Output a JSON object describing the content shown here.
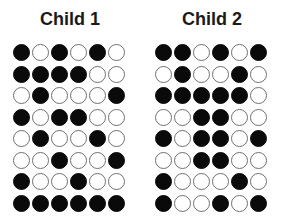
{
  "figure": {
    "panels": [
      {
        "title": "Child 1",
        "legend": {
          "filled": "black circle",
          "empty": "white circle"
        },
        "rows": [
          [
            1,
            0,
            1,
            0,
            1,
            0
          ],
          [
            1,
            1,
            1,
            1,
            0,
            0
          ],
          [
            0,
            1,
            0,
            0,
            0,
            1
          ],
          [
            1,
            0,
            1,
            1,
            0,
            0
          ],
          [
            0,
            1,
            0,
            0,
            1,
            0
          ],
          [
            0,
            0,
            1,
            0,
            0,
            1
          ],
          [
            1,
            0,
            0,
            1,
            0,
            0
          ],
          [
            1,
            1,
            1,
            1,
            1,
            1
          ]
        ]
      },
      {
        "title": "Child 2",
        "rows": [
          [
            1,
            1,
            0,
            1,
            0,
            1
          ],
          [
            0,
            1,
            0,
            0,
            1,
            0
          ],
          [
            1,
            1,
            1,
            1,
            1,
            0
          ],
          [
            0,
            0,
            1,
            1,
            0,
            0
          ],
          [
            1,
            0,
            1,
            1,
            0,
            1
          ],
          [
            0,
            0,
            1,
            1,
            0,
            0
          ],
          [
            1,
            0,
            0,
            0,
            1,
            0
          ],
          [
            1,
            0,
            0,
            1,
            0,
            1
          ]
        ]
      }
    ],
    "colors": {
      "filled": "#0a0a0a",
      "empty": "#ffffff",
      "outline": "#707070",
      "title": "#1a1a1a"
    }
  }
}
